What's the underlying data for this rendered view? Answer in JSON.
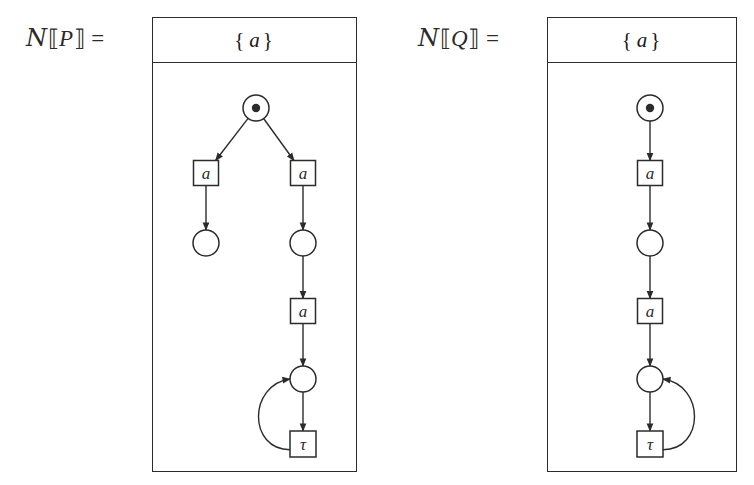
{
  "figure": {
    "type": "petri-net-diagram",
    "caption_present": false,
    "background": "#ffffff",
    "stroke_color": "#2b2b2b",
    "width": 754,
    "height": 485
  },
  "left": {
    "label": {
      "script_n": "ᵊ",
      "n_glyph": "N",
      "open_bracket": "⟦",
      "argument": "P",
      "close_bracket": "⟧",
      "equals": "="
    },
    "header": {
      "open_brace": "{",
      "items": [
        "a"
      ],
      "close_brace": "}"
    },
    "box": {
      "x": 152,
      "y": 17,
      "width": 205,
      "height": 455,
      "header_height": 45
    },
    "places": [
      {
        "id": "p0",
        "name": "initial-place",
        "cx": 255,
        "cy": 107,
        "r": 13,
        "token": true
      },
      {
        "id": "p1",
        "name": "place-left-branch",
        "cx": 205,
        "cy": 242,
        "r": 13,
        "token": false
      },
      {
        "id": "p2",
        "name": "place-right-branch",
        "cx": 302,
        "cy": 242,
        "r": 13,
        "token": false
      },
      {
        "id": "p3",
        "name": "place-loop",
        "cx": 302,
        "cy": 378,
        "r": 13,
        "token": false
      }
    ],
    "transitions": [
      {
        "id": "t0",
        "name": "transition-a-left",
        "label": "a",
        "cx": 205,
        "cy": 172,
        "w": 25,
        "h": 25
      },
      {
        "id": "t1",
        "name": "transition-a-right",
        "label": "a",
        "cx": 302,
        "cy": 172,
        "w": 25,
        "h": 25
      },
      {
        "id": "t2",
        "name": "transition-a-second",
        "label": "a",
        "cx": 302,
        "cy": 310,
        "w": 25,
        "h": 25
      },
      {
        "id": "t3",
        "name": "transition-tau",
        "label": "τ",
        "cx": 302,
        "cy": 443,
        "w": 26,
        "h": 26
      }
    ],
    "arcs": [
      {
        "from": "p0",
        "to": "t0",
        "kind": "diagonal"
      },
      {
        "from": "p0",
        "to": "t1",
        "kind": "diagonal"
      },
      {
        "from": "t0",
        "to": "p1",
        "kind": "straight"
      },
      {
        "from": "t1",
        "to": "p2",
        "kind": "straight"
      },
      {
        "from": "p2",
        "to": "t2",
        "kind": "straight"
      },
      {
        "from": "t2",
        "to": "p3",
        "kind": "straight"
      },
      {
        "from": "p3",
        "to": "t3",
        "kind": "straight"
      },
      {
        "from": "t3",
        "to": "p3",
        "kind": "curved-left"
      }
    ]
  },
  "right": {
    "label": {
      "script_n": "ᵊ",
      "n_glyph": "N",
      "open_bracket": "⟦",
      "argument": "Q",
      "close_bracket": "⟧",
      "equals": "="
    },
    "header": {
      "open_brace": "{",
      "items": [
        "a"
      ],
      "close_brace": "}"
    },
    "box": {
      "x": 547,
      "y": 17,
      "width": 190,
      "height": 455,
      "header_height": 45
    },
    "places": [
      {
        "id": "q0",
        "name": "initial-place",
        "cx": 649,
        "cy": 107,
        "r": 13,
        "token": true
      },
      {
        "id": "q1",
        "name": "place-middle",
        "cx": 649,
        "cy": 242,
        "r": 13,
        "token": false
      },
      {
        "id": "q2",
        "name": "place-loop",
        "cx": 649,
        "cy": 378,
        "r": 13,
        "token": false
      }
    ],
    "transitions": [
      {
        "id": "u0",
        "name": "transition-a-first",
        "label": "a",
        "cx": 649,
        "cy": 172,
        "w": 25,
        "h": 25
      },
      {
        "id": "u1",
        "name": "transition-a-second",
        "label": "a",
        "cx": 649,
        "cy": 310,
        "w": 25,
        "h": 25
      },
      {
        "id": "u2",
        "name": "transition-tau",
        "label": "τ",
        "cx": 649,
        "cy": 443,
        "w": 26,
        "h": 26
      }
    ],
    "arcs": [
      {
        "from": "q0",
        "to": "u0",
        "kind": "straight"
      },
      {
        "from": "u0",
        "to": "q1",
        "kind": "straight"
      },
      {
        "from": "q1",
        "to": "u1",
        "kind": "straight"
      },
      {
        "from": "u1",
        "to": "q2",
        "kind": "straight"
      },
      {
        "from": "q2",
        "to": "u2",
        "kind": "straight"
      },
      {
        "from": "u2",
        "to": "q2",
        "kind": "curved-right"
      }
    ]
  }
}
